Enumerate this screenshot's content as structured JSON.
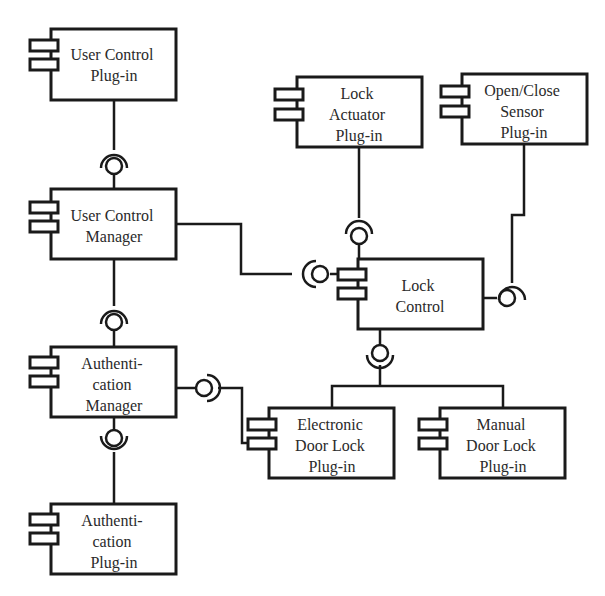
{
  "diagram": {
    "type": "UML component diagram",
    "components": [
      {
        "id": "user_control_plugin",
        "lines": [
          "User Control",
          "Plug-in"
        ]
      },
      {
        "id": "user_control_manager",
        "lines": [
          "User Control",
          "Manager"
        ]
      },
      {
        "id": "authentication_manager",
        "lines": [
          "Authenti-",
          "cation",
          "Manager"
        ]
      },
      {
        "id": "authentication_plugin",
        "lines": [
          "Authenti-",
          "cation",
          "Plug-in"
        ]
      },
      {
        "id": "lock_actuator_plugin",
        "lines": [
          "Lock",
          "Actuator",
          "Plug-in"
        ]
      },
      {
        "id": "open_close_sensor_plugin",
        "lines": [
          "Open/Close",
          "Sensor",
          "Plug-in"
        ]
      },
      {
        "id": "lock_control",
        "lines": [
          "Lock",
          "Control"
        ]
      },
      {
        "id": "electronic_door_lock_plugin",
        "lines": [
          "Electronic",
          "Door Lock",
          "Plug-in"
        ]
      },
      {
        "id": "manual_door_lock_plugin",
        "lines": [
          "Manual",
          "Door Lock",
          "Plug-in"
        ]
      }
    ],
    "connections": [
      {
        "from": "user_control_plugin",
        "to": "user_control_manager",
        "type": "ball-and-socket"
      },
      {
        "from": "user_control_manager",
        "to": "authentication_manager",
        "type": "ball-and-socket"
      },
      {
        "from": "authentication_manager",
        "to": "authentication_plugin",
        "type": "ball-and-socket"
      },
      {
        "from": "user_control_manager",
        "to": "lock_control",
        "type": "ball-and-socket"
      },
      {
        "from": "lock_actuator_plugin",
        "to": "lock_control",
        "type": "ball-and-socket"
      },
      {
        "from": "open_close_sensor_plugin",
        "to": "lock_control",
        "type": "ball-and-socket"
      },
      {
        "from": "lock_control",
        "to": "electronic_door_lock_plugin",
        "type": "ball-and-socket"
      },
      {
        "from": "lock_control",
        "to": "manual_door_lock_plugin",
        "type": "ball-and-socket"
      },
      {
        "from": "authentication_manager",
        "to": "electronic_door_lock_plugin",
        "type": "ball-and-socket"
      }
    ]
  }
}
